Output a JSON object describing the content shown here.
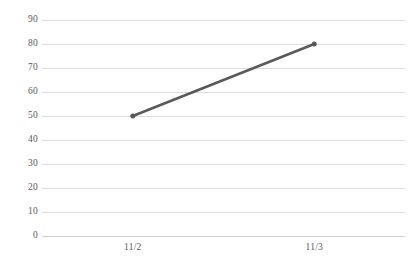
{
  "chart_data": {
    "type": "line",
    "title": "",
    "subtitle": "",
    "xlabel": "",
    "ylabel": "",
    "categories": [
      "11/2",
      "11/3"
    ],
    "series": [
      {
        "name": "",
        "values": [
          50,
          80
        ],
        "color": "#595959",
        "marker": "circle",
        "line_width": 2.5,
        "marker_size": 5
      }
    ],
    "x": [
      "11/2",
      "11/3"
    ],
    "ylim": [
      0,
      90
    ],
    "y_ticks": [
      0,
      10,
      20,
      30,
      40,
      50,
      60,
      70,
      80,
      90
    ],
    "y_tick_labels": [
      "0",
      "10",
      "20",
      "30",
      "40",
      "50",
      "60",
      "70",
      "80",
      "90"
    ],
    "x_tick_labels": [
      "11/2",
      "11/3"
    ],
    "grid": {
      "horizontal": true,
      "vertical": false,
      "color": "#dcdcdc"
    },
    "legend": {
      "visible": false,
      "position": "none",
      "entries": []
    },
    "axis": {
      "baseline_color": "#d2d2d2",
      "tick_label_color": "#5a5a5a",
      "y_axis_line": false,
      "x_axis_line": true
    },
    "background_color": "#ffffff",
    "annotations": [],
    "points": [
      {
        "x": "11/2",
        "y": 50
      },
      {
        "x": "11/3",
        "y": 80
      }
    ]
  }
}
